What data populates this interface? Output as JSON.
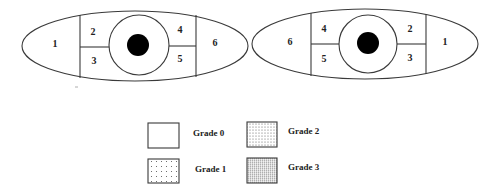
{
  "figure": {
    "type": "eye-zone-grading-diagram",
    "eyes": [
      {
        "id": "left-eye",
        "zones": [
          {
            "id": "zone-1",
            "label": "1"
          },
          {
            "id": "zone-2",
            "label": "2"
          },
          {
            "id": "zone-3",
            "label": "3"
          },
          {
            "id": "zone-4",
            "label": "4"
          },
          {
            "id": "zone-5",
            "label": "5"
          },
          {
            "id": "zone-6",
            "label": "6"
          }
        ]
      },
      {
        "id": "right-eye",
        "zones": [
          {
            "id": "zone-6",
            "label": "6"
          },
          {
            "id": "zone-4",
            "label": "4"
          },
          {
            "id": "zone-5",
            "label": "5"
          },
          {
            "id": "zone-2",
            "label": "2"
          },
          {
            "id": "zone-3",
            "label": "3"
          },
          {
            "id": "zone-1",
            "label": "1"
          }
        ]
      }
    ],
    "legend": {
      "items": [
        {
          "label": "Grade 0",
          "pattern": "none"
        },
        {
          "label": "Grade 1",
          "pattern": "sparse-dots"
        },
        {
          "label": "Grade 2",
          "pattern": "medium-dots"
        },
        {
          "label": "Grade 3",
          "pattern": "dense-dots"
        }
      ]
    },
    "colors": {
      "outline": "#3a3a3a",
      "pupil": "#000000",
      "background": "#ffffff"
    }
  }
}
